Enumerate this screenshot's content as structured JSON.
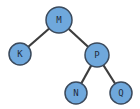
{
  "diagram": {
    "type": "binary-tree",
    "colors": {
      "node_fill": "#6fa8dc",
      "node_stroke": "#3b4a5c",
      "edge": "#3d3d3d",
      "text": "#1f2d3d"
    },
    "nodes": [
      {
        "id": "M",
        "label": "M",
        "x": 59,
        "y": 20,
        "r": 13
      },
      {
        "id": "K",
        "label": "K",
        "x": 20,
        "y": 54,
        "r": 11
      },
      {
        "id": "P",
        "label": "P",
        "x": 97,
        "y": 55,
        "r": 12
      },
      {
        "id": "N",
        "label": "N",
        "x": 76,
        "y": 93,
        "r": 11
      },
      {
        "id": "Q",
        "label": "Q",
        "x": 121,
        "y": 93,
        "r": 11
      }
    ],
    "edges": [
      {
        "from": "M",
        "to": "K"
      },
      {
        "from": "M",
        "to": "P"
      },
      {
        "from": "P",
        "to": "N"
      },
      {
        "from": "P",
        "to": "Q"
      }
    ]
  }
}
